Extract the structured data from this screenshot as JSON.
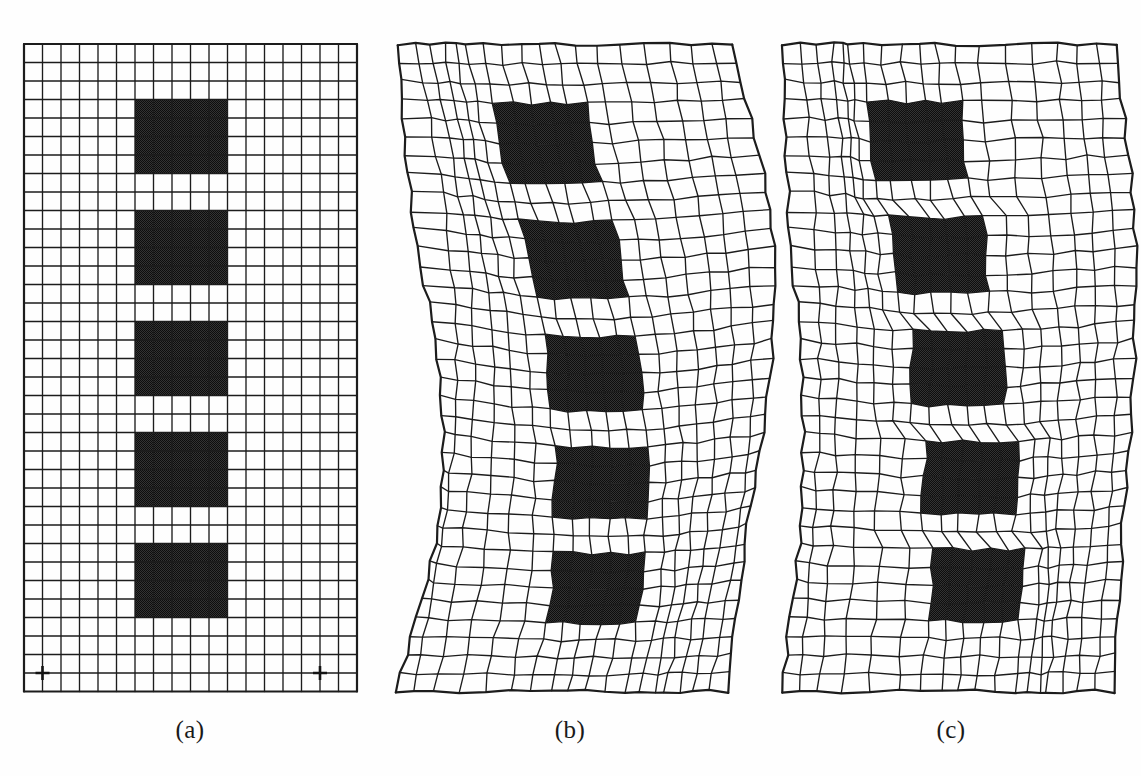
{
  "figure": {
    "background_color": "#fefefe",
    "width": 1141,
    "height": 776
  },
  "style": {
    "mesh_line_color": "#1c1c1c",
    "dark_cell_color": "#333333",
    "light_cell_color": "#ffffff",
    "dark_cell_pattern": "dither-halftone",
    "caption_color": "#1a1a1a",
    "line_width_minor": 1.35,
    "line_width_border": 2.2
  },
  "grid": {
    "cols": 18,
    "rows": 35,
    "cell_px": 18.5,
    "origin_x": 24,
    "origin_y": 26,
    "dark_block_col_start": 6,
    "dark_block_col_end": 11,
    "dark_block_rows": [
      [
        3,
        8
      ],
      [
        9,
        14
      ],
      [
        15,
        20
      ],
      [
        21,
        26
      ],
      [
        27,
        32
      ]
    ],
    "gap_rows": [
      8,
      14,
      20,
      26
    ],
    "top_margin_rows": 3,
    "bottom_margin_rows": 3
  },
  "panels": [
    {
      "id": "a",
      "caption": "(a)",
      "name": "undeformed-reference-mesh",
      "deformation": "none",
      "description": "Undeformed reference mesh with five stacked dark inclusion blocks",
      "show_supports": true,
      "supports": [
        {
          "col": 1,
          "row": 34
        },
        {
          "col": 16,
          "row": 34
        }
      ],
      "warp": {
        "mode": "none",
        "bend_amplitude": 0,
        "block_shift": 0,
        "shear_sharpness": 0,
        "wobble": 0
      }
    },
    {
      "id": "b",
      "caption": "(b)",
      "name": "smooth-warped-mesh",
      "deformation": "smooth-bending",
      "description": "Continuously warped mesh; blocks translate laterally with smooth diffuse shear spread through surrounding elements",
      "show_supports": false,
      "warp": {
        "mode": "smooth",
        "bend_amplitude": 34,
        "block_shift": 26,
        "shear_sharpness": 0.3,
        "wobble": 2.2,
        "vertical_sag": 16,
        "edge_curve": 26
      }
    },
    {
      "id": "c",
      "caption": "(c)",
      "name": "shear-band-mesh",
      "deformation": "localized-shear-bands",
      "description": "Deformed mesh with sharp localized shear bands concentrated in the single-row gaps between blocks",
      "show_supports": false,
      "warp": {
        "mode": "sharp",
        "bend_amplitude": 16,
        "block_shift": 30,
        "shear_sharpness": 0.94,
        "wobble": 2.6,
        "vertical_sag": 10,
        "edge_curve": 12
      }
    }
  ],
  "chart_data": {
    "type": "diagram",
    "subtype": "finite-element-mesh-deformation",
    "panel_labels": [
      "(a)",
      "(b)",
      "(c)"
    ],
    "panel_descriptions": [
      "Undeformed reference mesh",
      "Smoothly warped / bent deformation",
      "Deformation with sharp localized shear bands"
    ],
    "grid_columns": 18,
    "grid_rows": 35,
    "dark_block_count": 5,
    "dark_block_width_cells": 5,
    "dark_block_height_cells": 5,
    "gap_height_cells": 1,
    "support_points": 2
  }
}
